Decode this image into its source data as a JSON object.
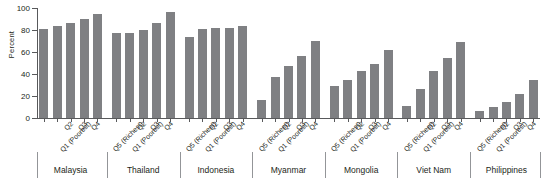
{
  "chart_data": {
    "type": "bar",
    "title": "",
    "subtitle": "",
    "xlabel": "",
    "ylabel": "Percent",
    "ylim": [
      0,
      100
    ],
    "yticks": [
      0,
      20,
      40,
      60,
      80,
      100
    ],
    "grid": false,
    "legend": null,
    "bar_color": "#7f8083",
    "axis_color": "#58595b",
    "categories": [
      "Q1 (Poorest)",
      "Q2",
      "Q3",
      "Q4",
      "Q5 (Richest)"
    ],
    "groups": [
      {
        "name": "Malaysia",
        "values": [
          81,
          84,
          86,
          90,
          95
        ]
      },
      {
        "name": "Thailand",
        "values": [
          77,
          77,
          80,
          86,
          96
        ]
      },
      {
        "name": "Indonesia",
        "values": [
          74,
          81,
          82,
          82,
          84
        ]
      },
      {
        "name": "Myanmar",
        "values": [
          16,
          37,
          47,
          56,
          70
        ]
      },
      {
        "name": "Mongolia",
        "values": [
          29,
          35,
          43,
          49,
          62
        ]
      },
      {
        "name": "Viet Nam",
        "values": [
          11,
          26,
          43,
          55,
          69
        ]
      },
      {
        "name": "Philippines",
        "values": [
          6,
          10,
          15,
          22,
          35
        ]
      }
    ]
  },
  "axis": {
    "y_label": "Percent",
    "y_tick_labels": [
      "0",
      "20",
      "40",
      "60",
      "80",
      "100"
    ]
  }
}
